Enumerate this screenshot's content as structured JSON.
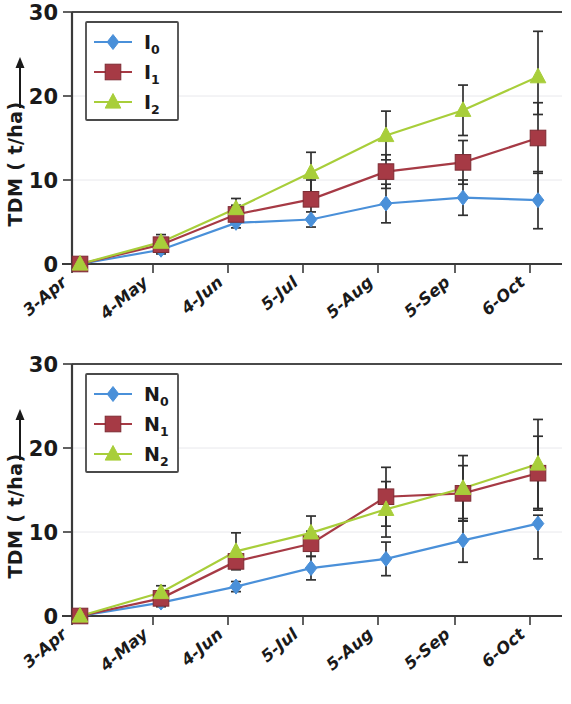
{
  "figure": {
    "background": "#ffffff",
    "panels": [
      "top",
      "bottom"
    ]
  },
  "colors": {
    "series_blue": "#4a90d9",
    "series_red": "#a63a45",
    "series_green": "#a8ce3a",
    "axis": "#3a3a3a",
    "error_bar": "#303030",
    "gridline": "#e8e8ec",
    "text": "#1a1a1a"
  },
  "chart_data": [
    {
      "panel": "top",
      "type": "line",
      "title": "",
      "xlabel": "",
      "ylabel": "TDM ( t/ha)",
      "ylabel_arrow": "⟶",
      "categories": [
        "3-Apr",
        "4-May",
        "4-Jun",
        "5-Jul",
        "5-Aug",
        "5-Sep",
        "6-Oct"
      ],
      "yticks": [
        0,
        10,
        20,
        30
      ],
      "ylim": [
        0,
        30
      ],
      "grid": true,
      "legend_position": "top-left",
      "series": [
        {
          "name": "I0",
          "label_base": "I",
          "label_sub": "0",
          "color": "#4a90d9",
          "marker": "diamond",
          "values": [
            0,
            1.7,
            4.9,
            5.3,
            7.2,
            7.9,
            7.6
          ],
          "err_low": [
            0,
            0.5,
            0.6,
            0.9,
            2.3,
            2.1,
            3.4
          ],
          "err_high": [
            0,
            0.5,
            0.6,
            0.9,
            2.3,
            2.1,
            3.4
          ]
        },
        {
          "name": "I1",
          "label_base": "I",
          "label_sub": "1",
          "color": "#a63a45",
          "marker": "square",
          "values": [
            0,
            2.3,
            5.9,
            7.7,
            11.0,
            12.1,
            15.0
          ],
          "err_low": [
            0,
            0.6,
            1.1,
            2.3,
            2.0,
            2.6,
            4.2
          ],
          "err_high": [
            0,
            0.6,
            1.1,
            2.3,
            2.0,
            2.6,
            4.2
          ]
        },
        {
          "name": "I2",
          "label_base": "I",
          "label_sub": "2",
          "color": "#a8ce3a",
          "marker": "triangle",
          "values": [
            0,
            2.6,
            6.6,
            10.9,
            15.3,
            18.3,
            22.3
          ],
          "err_low": [
            0,
            0.9,
            1.2,
            2.4,
            2.9,
            3.0,
            4.5
          ],
          "err_high": [
            0,
            0.9,
            1.2,
            2.4,
            2.9,
            3.0,
            5.4
          ]
        }
      ]
    },
    {
      "panel": "bottom",
      "type": "line",
      "title": "",
      "xlabel": "",
      "ylabel": "TDM ( t/ha)",
      "ylabel_arrow": "⟶",
      "categories": [
        "3-Apr",
        "4-May",
        "4-Jun",
        "5-Jul",
        "5-Aug",
        "5-Sep",
        "6-Oct"
      ],
      "yticks": [
        0,
        10,
        20,
        30
      ],
      "ylim": [
        0,
        30
      ],
      "grid": true,
      "legend_position": "top-left",
      "series": [
        {
          "name": "N0",
          "label_base": "N",
          "label_sub": "0",
          "color": "#4a90d9",
          "marker": "diamond",
          "values": [
            0,
            1.6,
            3.5,
            5.7,
            6.8,
            9.0,
            11.0
          ],
          "err_low": [
            0,
            0.5,
            0.6,
            1.4,
            2.0,
            2.6,
            4.2
          ],
          "err_high": [
            0,
            0.5,
            0.6,
            1.4,
            2.0,
            2.6,
            1.0
          ]
        },
        {
          "name": "N1",
          "label_base": "N",
          "label_sub": "1",
          "color": "#a63a45",
          "marker": "square",
          "values": [
            0,
            2.1,
            6.5,
            8.6,
            14.2,
            14.6,
            17.0
          ],
          "err_low": [
            0,
            0.7,
            0.9,
            1.5,
            3.5,
            3.3,
            4.4
          ],
          "err_high": [
            0,
            0.7,
            0.9,
            1.5,
            3.5,
            3.3,
            4.4
          ]
        },
        {
          "name": "N2",
          "label_base": "N",
          "label_sub": "2",
          "color": "#a8ce3a",
          "marker": "triangle",
          "values": [
            0,
            2.8,
            7.7,
            9.9,
            12.7,
            15.2,
            18.1
          ],
          "err_low": [
            0,
            0.8,
            2.2,
            2.0,
            3.3,
            3.9,
            5.3
          ],
          "err_high": [
            0,
            0.8,
            2.2,
            2.0,
            3.3,
            3.9,
            5.3
          ]
        }
      ]
    }
  ]
}
